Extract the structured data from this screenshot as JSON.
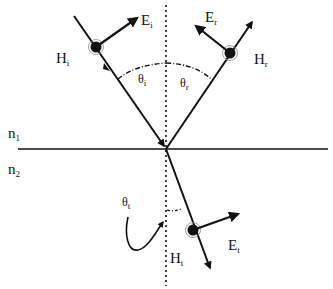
{
  "diagram": {
    "media": {
      "upper": {
        "symbol": "n",
        "subscript": "1"
      },
      "lower": {
        "symbol": "n",
        "subscript": "2"
      }
    },
    "incident": {
      "E": {
        "symbol": "E",
        "subscript": "i"
      },
      "H": {
        "symbol": "H",
        "subscript": "i"
      },
      "angle": {
        "symbol": "θ",
        "subscript": "i"
      }
    },
    "reflected": {
      "E": {
        "symbol": "E",
        "subscript": "r"
      },
      "H": {
        "symbol": "H",
        "subscript": "r"
      },
      "angle": {
        "symbol": "θ",
        "subscript": "r"
      }
    },
    "transmitted": {
      "E": {
        "symbol": "E",
        "subscript": "t"
      },
      "H": {
        "symbol": "H",
        "subscript": "t"
      },
      "angle": {
        "symbol": "θ",
        "subscript": "t"
      }
    },
    "colors": {
      "line": "#111111",
      "background": "#ffffff"
    }
  }
}
